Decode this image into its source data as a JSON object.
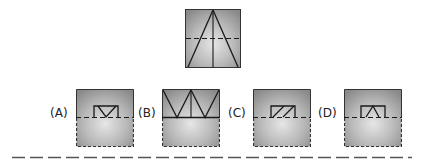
{
  "question": {
    "figure_label": "folded-paper-with-cut",
    "fold_line": "dashed horizontal midline"
  },
  "options": [
    {
      "label": "(A)",
      "pattern": "rectangle-with-diagonal-v"
    },
    {
      "label": "(B)",
      "pattern": "double-v-zigzag"
    },
    {
      "label": "(C)",
      "pattern": "parallelogram-slashes"
    },
    {
      "label": "(D)",
      "pattern": "trapezoid-inverted-v"
    }
  ],
  "colors": {
    "paper_fill_light": "#e4e4e4",
    "paper_fill_dark": "#8a8a8a",
    "line": "#1a1a1a",
    "divider": "#555555"
  }
}
